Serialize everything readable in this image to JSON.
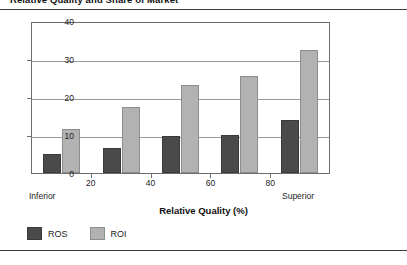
{
  "figure": {
    "title": "Relative Quality and Share of Market",
    "x_axis_title": "Relative Quality (%)",
    "left_endcap": "Inferior",
    "right_endcap": "Superior"
  },
  "legend": {
    "items": [
      {
        "label": "ROS",
        "color": "#4a4a4a",
        "name": "ros"
      },
      {
        "label": "ROI",
        "color": "#b2b2b2",
        "name": "roi"
      }
    ]
  },
  "chart_data": {
    "type": "bar",
    "title": "Relative Quality and Share of Market",
    "xlabel": "Relative Quality (%)",
    "ylabel": "",
    "ylim": [
      0,
      40
    ],
    "yticks": [
      0,
      10,
      20,
      30,
      40
    ],
    "ytick_labels": [
      "0",
      "10",
      "20",
      "30",
      "40"
    ],
    "xticks": [
      20,
      40,
      60,
      80
    ],
    "xtick_labels": [
      "20",
      "40",
      "60",
      "80"
    ],
    "x_endcaps": {
      "left": "Inferior",
      "right": "Superior"
    },
    "grid": true,
    "grid_axis": "y",
    "legend_position": "below-left",
    "categories": [
      "0-20",
      "20-40",
      "40-60",
      "60-80",
      "80-100"
    ],
    "series": [
      {
        "name": "ROS",
        "color": "#4a4a4a",
        "values": [
          5.0,
          6.6,
          9.7,
          10.1,
          14.0
        ]
      },
      {
        "name": "ROI",
        "color": "#b2b2b2",
        "values": [
          11.7,
          17.5,
          23.2,
          25.5,
          32.5
        ]
      }
    ]
  }
}
